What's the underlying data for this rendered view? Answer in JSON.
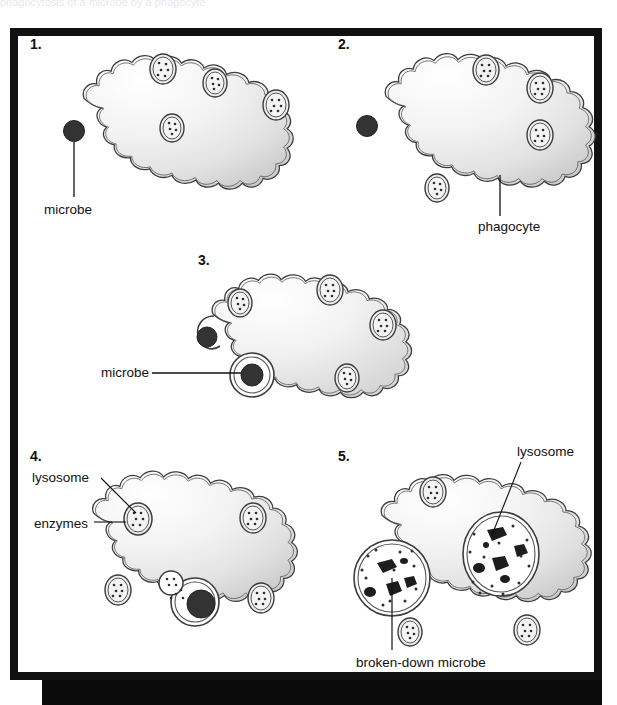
{
  "figure": {
    "title_fragment_top": "phagocytosis of a microbe by a phagocyte",
    "frame_color": "#111111",
    "cell_fill_light": "#fdfdfd",
    "cell_fill_dark": "#cfcfcf",
    "membrane_color": "#3a3a3a",
    "microbe_color": "#333333",
    "label_color": "#111111"
  },
  "panels": [
    {
      "number": "1.",
      "labels": [
        {
          "text": "microbe",
          "name": "label-microbe-1"
        }
      ]
    },
    {
      "number": "2.",
      "labels": [
        {
          "text": "phagocyte",
          "name": "label-phagocyte-2"
        }
      ]
    },
    {
      "number": "3.",
      "labels": [
        {
          "text": "microbe",
          "name": "label-microbe-3"
        }
      ]
    },
    {
      "number": "4.",
      "labels": [
        {
          "text": "lysosome",
          "name": "label-lysosome-4"
        },
        {
          "text": "enzymes",
          "name": "label-enzymes-4"
        }
      ]
    },
    {
      "number": "5.",
      "labels": [
        {
          "text": "lysosome",
          "name": "label-lysosome-5"
        },
        {
          "text": "broken-down microbe",
          "name": "label-broken-down-microbe-5"
        }
      ]
    }
  ],
  "label_text": {
    "microbe_1": "microbe",
    "phagocyte_2": "phagocyte",
    "microbe_3": "microbe",
    "lysosome_4": "lysosome",
    "enzymes_4": "enzymes",
    "lysosome_5": "lysosome",
    "broken_down_microbe_5": "broken-down microbe"
  },
  "panel_numbers": {
    "p1": "1.",
    "p2": "2.",
    "p3": "3.",
    "p4": "4.",
    "p5": "5."
  }
}
